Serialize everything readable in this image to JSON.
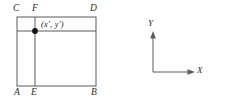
{
  "figure": {
    "background_color": "#fefefe",
    "line_color": "#5a5a5a",
    "text_color": "#2b2b2b",
    "point_color": "#111111",
    "square_diagram": {
      "name": "labeled-square-with-interior-point",
      "vertex_labels": {
        "top_left": "C",
        "top_mid": "F",
        "top_right": "D",
        "bottom_left": "A",
        "bottom_mid": "E",
        "bottom_right": "B"
      },
      "point_label": "(x', y')",
      "geometry": {
        "left": 17,
        "right": 96,
        "top": 17,
        "bottom": 86,
        "vertical_line_x": 35,
        "horizontal_line_y": 31,
        "point_x": 35,
        "point_y": 31,
        "point_radius": 2.9
      }
    },
    "axes_diagram": {
      "name": "cartesian-axes",
      "x_axis_label": "X",
      "y_axis_label": "Y",
      "geometry": {
        "origin_x": 153,
        "origin_y": 72,
        "x_tip": 195,
        "y_tip": 32
      }
    }
  }
}
